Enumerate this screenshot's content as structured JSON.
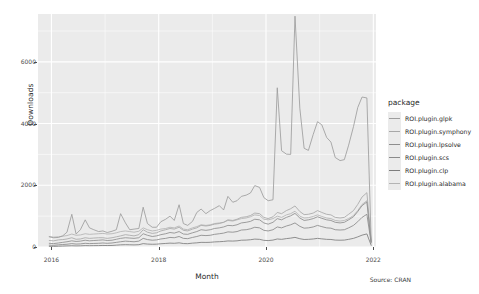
{
  "chart_data": {
    "type": "line",
    "title": "",
    "xlabel": "Month",
    "ylabel": "Downloads",
    "caption": "Source: CRAN",
    "legend_title": "package",
    "legend_position": "right",
    "grid": true,
    "xlim": [
      2015.75,
      2022.05
    ],
    "ylim": [
      0,
      7550
    ],
    "xticks": [
      "2016",
      "2018",
      "2020",
      "2022"
    ],
    "xtick_values": [
      2016,
      2018,
      2020,
      2022
    ],
    "yticks": [
      "0",
      "2000",
      "4000",
      "6000"
    ],
    "ytick_values": [
      0,
      2000,
      4000,
      6000
    ],
    "x_unit": "year (monthly samples)",
    "series": [
      {
        "name": "ROI.plugin.glpk",
        "color": "#9d9d9d",
        "x": [
          2015.96,
          2016.04,
          2016.13,
          2016.21,
          2016.29,
          2016.38,
          2016.46,
          2016.54,
          2016.63,
          2016.71,
          2016.79,
          2016.88,
          2016.96,
          2017.04,
          2017.13,
          2017.21,
          2017.29,
          2017.38,
          2017.46,
          2017.54,
          2017.63,
          2017.71,
          2017.79,
          2017.88,
          2017.96,
          2018.04,
          2018.13,
          2018.21,
          2018.29,
          2018.38,
          2018.46,
          2018.54,
          2018.63,
          2018.71,
          2018.79,
          2018.88,
          2018.96,
          2019.04,
          2019.13,
          2019.21,
          2019.29,
          2019.38,
          2019.46,
          2019.54,
          2019.63,
          2019.71,
          2019.79,
          2019.88,
          2019.96,
          2020.04,
          2020.13,
          2020.21,
          2020.29,
          2020.38,
          2020.46,
          2020.54,
          2020.63,
          2020.71,
          2020.79,
          2020.88,
          2020.96,
          2021.04,
          2021.13,
          2021.21,
          2021.29,
          2021.38,
          2021.46,
          2021.54,
          2021.63,
          2021.71,
          2021.79,
          2021.88,
          2021.96
        ],
        "values": [
          330,
          300,
          310,
          360,
          480,
          1060,
          420,
          560,
          880,
          620,
          560,
          500,
          520,
          470,
          510,
          560,
          1080,
          780,
          560,
          580,
          600,
          1290,
          760,
          640,
          640,
          820,
          900,
          1000,
          860,
          1370,
          760,
          700,
          830,
          1120,
          1230,
          1080,
          1180,
          1250,
          1340,
          1200,
          1640,
          1450,
          1500,
          1640,
          1680,
          1750,
          1990,
          1930,
          1600,
          1500,
          1530,
          5160,
          3120,
          3010,
          3000,
          7480,
          4500,
          3200,
          3130,
          3650,
          4060,
          3960,
          3550,
          3400,
          2900,
          2800,
          2830,
          3300,
          3900,
          4520,
          4860,
          4830,
          180
        ]
      },
      {
        "name": "ROI.plugin.symphony",
        "color": "#a8a8a8",
        "x": [
          2015.96,
          2016.04,
          2016.13,
          2016.21,
          2016.29,
          2016.38,
          2016.46,
          2016.54,
          2016.63,
          2016.71,
          2016.79,
          2016.88,
          2016.96,
          2017.04,
          2017.13,
          2017.21,
          2017.29,
          2017.38,
          2017.46,
          2017.54,
          2017.63,
          2017.71,
          2017.79,
          2017.88,
          2017.96,
          2018.04,
          2018.13,
          2018.21,
          2018.29,
          2018.38,
          2018.46,
          2018.54,
          2018.63,
          2018.71,
          2018.79,
          2018.88,
          2018.96,
          2019.04,
          2019.13,
          2019.21,
          2019.29,
          2019.38,
          2019.46,
          2019.54,
          2019.63,
          2019.71,
          2019.79,
          2019.88,
          2019.96,
          2020.04,
          2020.13,
          2020.21,
          2020.29,
          2020.38,
          2020.46,
          2020.54,
          2020.63,
          2020.71,
          2020.79,
          2020.88,
          2020.96,
          2021.04,
          2021.13,
          2021.21,
          2021.29,
          2021.38,
          2021.46,
          2021.54,
          2021.63,
          2021.71,
          2021.79,
          2021.88,
          2021.96
        ],
        "values": [
          210,
          200,
          230,
          240,
          260,
          300,
          250,
          260,
          300,
          280,
          290,
          300,
          300,
          280,
          300,
          330,
          360,
          400,
          380,
          360,
          400,
          560,
          480,
          440,
          460,
          520,
          560,
          600,
          580,
          640,
          540,
          520,
          580,
          620,
          700,
          680,
          700,
          740,
          760,
          800,
          880,
          860,
          900,
          960,
          980,
          1020,
          1100,
          1080,
          960,
          920,
          980,
          1120,
          1080,
          1180,
          1240,
          1330,
          1150,
          1050,
          1060,
          1100,
          1180,
          1120,
          1060,
          1040,
          960,
          940,
          960,
          1060,
          1180,
          1380,
          1620,
          1760,
          190
        ]
      },
      {
        "name": "ROI.plugin.lpsolve",
        "color": "#8e8e8e",
        "x": [
          2015.96,
          2016.04,
          2016.13,
          2016.21,
          2016.29,
          2016.38,
          2016.46,
          2016.54,
          2016.63,
          2016.71,
          2016.79,
          2016.88,
          2016.96,
          2017.04,
          2017.13,
          2017.21,
          2017.29,
          2017.38,
          2017.46,
          2017.54,
          2017.63,
          2017.71,
          2017.79,
          2017.88,
          2017.96,
          2018.04,
          2018.13,
          2018.21,
          2018.29,
          2018.38,
          2018.46,
          2018.54,
          2018.63,
          2018.71,
          2018.79,
          2018.88,
          2018.96,
          2019.04,
          2019.13,
          2019.21,
          2019.29,
          2019.38,
          2019.46,
          2019.54,
          2019.63,
          2019.71,
          2019.79,
          2019.88,
          2019.96,
          2020.04,
          2020.13,
          2020.21,
          2020.29,
          2020.38,
          2020.46,
          2020.54,
          2020.63,
          2020.71,
          2020.79,
          2020.88,
          2020.96,
          2021.04,
          2021.13,
          2021.21,
          2021.29,
          2021.38,
          2021.46,
          2021.54,
          2021.63,
          2021.71,
          2021.79,
          2021.88,
          2021.96
        ],
        "values": [
          120,
          110,
          130,
          150,
          170,
          200,
          180,
          190,
          220,
          200,
          210,
          220,
          230,
          210,
          220,
          250,
          280,
          300,
          290,
          280,
          300,
          430,
          380,
          340,
          360,
          400,
          430,
          470,
          450,
          500,
          420,
          410,
          460,
          500,
          560,
          540,
          560,
          600,
          620,
          650,
          700,
          690,
          720,
          780,
          800,
          830,
          900,
          880,
          780,
          740,
          800,
          920,
          880,
          960,
          1010,
          1090,
          940,
          860,
          880,
          920,
          980,
          930,
          880,
          860,
          800,
          780,
          800,
          880,
          980,
          1150,
          1340,
          1460,
          160
        ]
      },
      {
        "name": "ROI.plugin.scs",
        "color": "#8a8a8a",
        "x": [
          2015.96,
          2016.04,
          2016.13,
          2016.21,
          2016.29,
          2016.38,
          2016.46,
          2016.54,
          2016.63,
          2016.71,
          2016.79,
          2016.88,
          2016.96,
          2017.04,
          2017.13,
          2017.21,
          2017.29,
          2017.38,
          2017.46,
          2017.54,
          2017.63,
          2017.71,
          2017.79,
          2017.88,
          2017.96,
          2018.04,
          2018.13,
          2018.21,
          2018.29,
          2018.38,
          2018.46,
          2018.54,
          2018.63,
          2018.71,
          2018.79,
          2018.88,
          2018.96,
          2019.04,
          2019.13,
          2019.21,
          2019.29,
          2019.38,
          2019.46,
          2019.54,
          2019.63,
          2019.71,
          2019.79,
          2019.88,
          2019.96,
          2020.04,
          2020.13,
          2020.21,
          2020.29,
          2020.38,
          2020.46,
          2020.54,
          2020.63,
          2020.71,
          2020.79,
          2020.88,
          2020.96,
          2021.04,
          2021.13,
          2021.21,
          2021.29,
          2021.38,
          2021.46,
          2021.54,
          2021.63,
          2021.71,
          2021.79,
          2021.88,
          2021.96
        ],
        "values": [
          60,
          55,
          70,
          80,
          90,
          110,
          95,
          100,
          120,
          110,
          115,
          120,
          130,
          120,
          130,
          150,
          170,
          190,
          180,
          170,
          190,
          280,
          240,
          220,
          230,
          260,
          280,
          310,
          300,
          340,
          280,
          270,
          310,
          340,
          380,
          370,
          380,
          410,
          430,
          450,
          490,
          480,
          500,
          550,
          560,
          590,
          640,
          620,
          540,
          520,
          560,
          650,
          620,
          680,
          720,
          780,
          670,
          610,
          620,
          650,
          700,
          660,
          620,
          610,
          560,
          550,
          560,
          620,
          700,
          820,
          960,
          1060,
          130
        ]
      },
      {
        "name": "ROI.plugin.clp",
        "color": "#7d7d7d",
        "x": [
          2015.96,
          2016.04,
          2016.13,
          2016.21,
          2016.29,
          2016.38,
          2016.46,
          2016.54,
          2016.63,
          2016.71,
          2016.79,
          2016.88,
          2016.96,
          2017.04,
          2017.13,
          2017.21,
          2017.29,
          2017.38,
          2017.46,
          2017.54,
          2017.63,
          2017.71,
          2017.79,
          2017.88,
          2017.96,
          2018.04,
          2018.13,
          2018.21,
          2018.29,
          2018.38,
          2018.46,
          2018.54,
          2018.63,
          2018.71,
          2018.79,
          2018.88,
          2018.96,
          2019.04,
          2019.13,
          2019.21,
          2019.29,
          2019.38,
          2019.46,
          2019.54,
          2019.63,
          2019.71,
          2019.79,
          2019.88,
          2019.96,
          2020.04,
          2020.13,
          2020.21,
          2020.29,
          2020.38,
          2020.46,
          2020.54,
          2020.63,
          2020.71,
          2020.79,
          2020.88,
          2020.96,
          2021.04,
          2021.13,
          2021.21,
          2021.29,
          2021.38,
          2021.46,
          2021.54,
          2021.63,
          2021.71,
          2021.79,
          2021.88,
          2021.96
        ],
        "values": [
          20,
          20,
          25,
          30,
          35,
          40,
          35,
          38,
          45,
          42,
          44,
          46,
          50,
          48,
          50,
          60,
          70,
          75,
          72,
          68,
          75,
          110,
          95,
          88,
          92,
          105,
          115,
          125,
          120,
          135,
          112,
          108,
          125,
          135,
          150,
          148,
          152,
          165,
          172,
          180,
          196,
          192,
          200,
          220,
          224,
          236,
          256,
          248,
          216,
          208,
          224,
          260,
          248,
          272,
          288,
          312,
          268,
          244,
          248,
          260,
          280,
          264,
          248,
          244,
          224,
          220,
          224,
          248,
          280,
          328,
          384,
          424,
          55
        ]
      },
      {
        "name": "ROI.plugin.alabama",
        "color": "#b4b4b4",
        "x": [
          2015.96,
          2016.04,
          2016.13,
          2016.21,
          2016.29,
          2016.38,
          2016.46,
          2016.54,
          2016.63,
          2016.71,
          2016.79,
          2016.88,
          2016.96,
          2017.04,
          2017.13,
          2017.21,
          2017.29,
          2017.38,
          2017.46,
          2017.54,
          2017.63,
          2017.71,
          2017.79,
          2017.88,
          2017.96,
          2018.04,
          2018.13,
          2018.21,
          2018.29,
          2018.38,
          2018.46,
          2018.54,
          2018.63,
          2018.71,
          2018.79,
          2018.88,
          2018.96,
          2019.04,
          2019.13,
          2019.21,
          2019.29,
          2019.38,
          2019.46,
          2019.54,
          2019.63,
          2019.71,
          2019.79,
          2019.88,
          2019.96,
          2020.04,
          2020.13,
          2020.21,
          2020.29,
          2020.38,
          2020.46,
          2020.54,
          2020.63,
          2020.71,
          2020.79,
          2020.88,
          2020.96,
          2021.04,
          2021.13,
          2021.21,
          2021.29,
          2021.38,
          2021.46,
          2021.54,
          2021.63,
          2021.71,
          2021.79,
          2021.88,
          2021.96
        ],
        "values": [
          340,
          320,
          330,
          350,
          370,
          420,
          380,
          390,
          430,
          410,
          420,
          430,
          440,
          420,
          430,
          460,
          500,
          520,
          500,
          480,
          510,
          620,
          560,
          520,
          540,
          580,
          600,
          640,
          620,
          680,
          580,
          560,
          620,
          660,
          720,
          700,
          720,
          760,
          780,
          800,
          860,
          840,
          880,
          920,
          940,
          980,
          1040,
          1020,
          900,
          880,
          920,
          1000,
          960,
          1040,
          1080,
          1160,
          1000,
          940,
          950,
          990,
          1040,
          990,
          940,
          920,
          860,
          840,
          860,
          920,
          1020,
          1180,
          1380,
          1500,
          170
        ]
      }
    ]
  },
  "axis": {
    "ylabel": "Downloads",
    "xlabel": "Month",
    "caption": "Source: CRAN"
  },
  "legend": {
    "title": "package",
    "items": [
      {
        "label": "ROI.plugin.glpk"
      },
      {
        "label": "ROI.plugin.symphony"
      },
      {
        "label": "ROI.plugin.lpsolve"
      },
      {
        "label": "ROI.plugin.scs"
      },
      {
        "label": "ROI.plugin.clp"
      },
      {
        "label": "ROI.plugin.alabama"
      }
    ]
  },
  "theme": {
    "panel_background": "#ebebeb",
    "grid_color": "#ffffff",
    "plot_background": "#ffffff",
    "text_color": "#1f1f1f"
  }
}
